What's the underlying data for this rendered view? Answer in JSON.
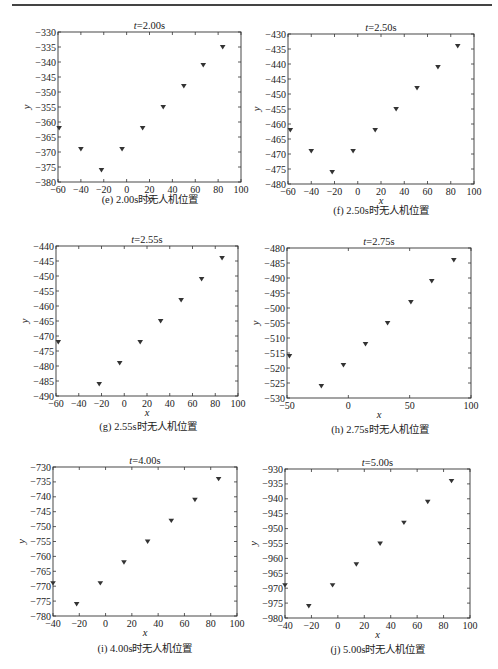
{
  "page": {
    "header_rule": true
  },
  "chart_data": [
    {
      "id": "e",
      "type": "scatter",
      "title": "t=2.00s",
      "caption": "(e) 2.00s时无人机位置",
      "xlabel": "x",
      "ylabel": "y",
      "xlim": [
        -60,
        100
      ],
      "ylim": [
        -380,
        -330
      ],
      "xticks": [
        -60,
        -40,
        -20,
        0,
        20,
        40,
        60,
        80,
        100
      ],
      "xtick_labels": [
        "-60",
        "-40",
        "-20",
        "0",
        "20",
        "40",
        "60",
        "80",
        "100"
      ],
      "yticks": [
        -380,
        -375,
        -370,
        -365,
        -360,
        -355,
        -350,
        -345,
        -340,
        -335,
        -330
      ],
      "grid": false,
      "marker": "down-triangle",
      "frame": {
        "left": 58,
        "top": 32,
        "right": 241,
        "bottom": 182
      },
      "caption_pos": {
        "x": 150,
        "y": 199
      },
      "points": [
        [
          -59,
          -362
        ],
        [
          -40,
          -369
        ],
        [
          -22,
          -376
        ],
        [
          -4,
          -369
        ],
        [
          14,
          -362
        ],
        [
          32,
          -355
        ],
        [
          50,
          -348
        ],
        [
          67,
          -341
        ],
        [
          84,
          -335
        ]
      ]
    },
    {
      "id": "f",
      "type": "scatter",
      "title": "t=2.50s",
      "caption": "(f) 2.50s时无人机位置",
      "xlabel": "x",
      "ylabel": "y",
      "xlim": [
        -60,
        100
      ],
      "ylim": [
        -480,
        -430
      ],
      "xticks": [
        -60,
        -40,
        -20,
        0,
        20,
        40,
        60,
        80,
        100
      ],
      "xtick_labels": [
        "-60",
        "-40",
        "-20",
        "0",
        "20",
        "40",
        "60",
        "80",
        "100"
      ],
      "yticks": [
        -480,
        -475,
        -470,
        -465,
        -460,
        -455,
        -450,
        -445,
        -440,
        -435,
        -430
      ],
      "grid": false,
      "marker": "down-triangle",
      "frame": {
        "left": 288,
        "top": 34,
        "right": 474,
        "bottom": 184
      },
      "caption_pos": {
        "x": 381,
        "y": 210
      },
      "points": [
        [
          -58,
          -462
        ],
        [
          -40,
          -469
        ],
        [
          -22,
          -476
        ],
        [
          -4,
          -469
        ],
        [
          15,
          -462
        ],
        [
          33,
          -455
        ],
        [
          51,
          -448
        ],
        [
          69,
          -441
        ],
        [
          86,
          -434
        ]
      ]
    },
    {
      "id": "g",
      "type": "scatter",
      "title": "t=2.55s",
      "caption": "(g) 2.55s时无人机位置",
      "xlabel": "x",
      "ylabel": "y",
      "xlim": [
        -60,
        100
      ],
      "ylim": [
        -490,
        -440
      ],
      "xticks": [
        -60,
        -40,
        -20,
        0,
        20,
        40,
        60,
        80,
        100
      ],
      "xtick_labels": [
        "-60",
        "-40",
        "-20",
        "0",
        "20",
        "40",
        "60",
        "80",
        "100"
      ],
      "yticks": [
        -490,
        -485,
        -480,
        -475,
        -470,
        -465,
        -460,
        -455,
        -450,
        -445,
        -440
      ],
      "grid": false,
      "marker": "down-triangle",
      "frame": {
        "left": 56,
        "top": 246,
        "right": 238,
        "bottom": 396
      },
      "caption_pos": {
        "x": 148,
        "y": 426
      },
      "points": [
        [
          -58,
          -472
        ],
        [
          -22,
          -486
        ],
        [
          -4,
          -479
        ],
        [
          14,
          -472
        ],
        [
          32,
          -465
        ],
        [
          50,
          -458
        ],
        [
          68,
          -451
        ],
        [
          86,
          -444
        ]
      ]
    },
    {
      "id": "h",
      "type": "scatter",
      "title": "t=2.75s",
      "caption": "(h) 2.75s时无人机位置",
      "xlabel": "x",
      "ylabel": "y",
      "xlim": [
        -50,
        100
      ],
      "ylim": [
        -530,
        -480
      ],
      "xticks": [
        -50,
        0,
        50,
        100
      ],
      "xtick_labels": [
        "-50",
        "0",
        "50",
        "100"
      ],
      "yticks": [
        -530,
        -525,
        -520,
        -515,
        -510,
        -505,
        -500,
        -495,
        -490,
        -485,
        -480
      ],
      "grid": false,
      "marker": "down-triangle",
      "frame": {
        "left": 287,
        "top": 248,
        "right": 471,
        "bottom": 398
      },
      "caption_pos": {
        "x": 380,
        "y": 429
      },
      "points": [
        [
          -48,
          -516
        ],
        [
          -22,
          -526
        ],
        [
          -4,
          -519
        ],
        [
          14,
          -512
        ],
        [
          32,
          -505
        ],
        [
          51,
          -498
        ],
        [
          68,
          -491
        ],
        [
          86,
          -484
        ]
      ]
    },
    {
      "id": "i",
      "type": "scatter",
      "title": "t=4.00s",
      "caption": "(i) 4.00s时无人机位置",
      "xlabel": "x",
      "ylabel": "y",
      "xlim": [
        -40,
        100
      ],
      "ylim": [
        -780,
        -730
      ],
      "xticks": [
        -40,
        -20,
        0,
        20,
        40,
        60,
        80,
        100
      ],
      "xtick_labels": [
        "-40",
        "-20",
        "0",
        "20",
        "40",
        "60",
        "80",
        "100"
      ],
      "yticks": [
        -780,
        -775,
        -770,
        -765,
        -760,
        -755,
        -750,
        -745,
        -740,
        -735,
        -730
      ],
      "grid": false,
      "marker": "down-triangle",
      "frame": {
        "left": 53,
        "top": 467,
        "right": 237,
        "bottom": 616
      },
      "caption_pos": {
        "x": 145,
        "y": 648
      },
      "points": [
        [
          -40,
          -769
        ],
        [
          -22,
          -776
        ],
        [
          -4,
          -769
        ],
        [
          14,
          -762
        ],
        [
          32,
          -755
        ],
        [
          50,
          -748
        ],
        [
          68,
          -741
        ],
        [
          86,
          -734
        ]
      ]
    },
    {
      "id": "j",
      "type": "scatter",
      "title": "t=5.00s",
      "caption": "(j) 5.00s时无人机位置",
      "xlabel": "x",
      "ylabel": "y",
      "xlim": [
        -40,
        100
      ],
      "ylim": [
        -980,
        -930
      ],
      "xticks": [
        -40,
        -20,
        0,
        20,
        40,
        60,
        80,
        100
      ],
      "xtick_labels": [
        "-40",
        "-20",
        "0",
        "20",
        "40",
        "60",
        "80",
        "100"
      ],
      "yticks": [
        -980,
        -975,
        -970,
        -965,
        -960,
        -955,
        -950,
        -945,
        -940,
        -935,
        -930
      ],
      "grid": false,
      "marker": "down-triangle",
      "frame": {
        "left": 285,
        "top": 469,
        "right": 470,
        "bottom": 618
      },
      "caption_pos": {
        "x": 378,
        "y": 649
      },
      "points": [
        [
          -40,
          -969
        ],
        [
          -22,
          -976
        ],
        [
          -4,
          -969
        ],
        [
          14,
          -962
        ],
        [
          32,
          -955
        ],
        [
          50,
          -948
        ],
        [
          68,
          -941
        ],
        [
          86,
          -934
        ]
      ]
    }
  ]
}
